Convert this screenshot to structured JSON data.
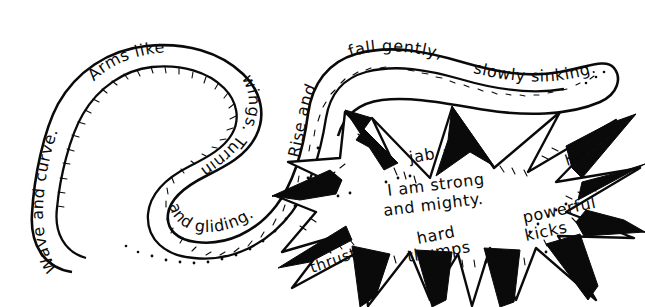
{
  "artwork": {
    "title": "Movement Words Shape Poem",
    "medium": "hand-drawn black ink line art on white paper",
    "ink_color": "#0a0a0a",
    "paper_color": "#ffffff"
  },
  "wave_shape": {
    "name": "flowing wave ribbon",
    "description": "A long serpentine double-outlined ribbon that snakes across the left and top of the page with words lettered along its curving band.",
    "phrase_full": "Wave and curve. Arms like wings. Turning and gliding. Rise and fall gently, slowly sinking.",
    "segments": [
      {
        "id": "seg1",
        "text": "Wave and curve."
      },
      {
        "id": "seg2",
        "text": "Arms like"
      },
      {
        "id": "seg3",
        "text": "wings. Turning"
      },
      {
        "id": "seg4",
        "text": "and gliding."
      },
      {
        "id": "seg5",
        "text": "Rise and"
      },
      {
        "id": "seg6",
        "text": "fall gently,"
      },
      {
        "id": "seg7",
        "text": "slowly sinking."
      }
    ]
  },
  "burst_shape": {
    "name": "jagged starburst",
    "description": "A spiky explosion / star burst outline filled white with black solid spikes, holding forceful action words.",
    "center_phrase": "I am strong and mighty.",
    "center_lines": [
      "I am strong",
      "and mighty."
    ],
    "words": [
      {
        "id": "word-jab",
        "text": "jab"
      },
      {
        "id": "word-hit",
        "text": "hit"
      },
      {
        "id": "word-powerful",
        "text": "powerful"
      },
      {
        "id": "word-kicks",
        "text": "kicks"
      },
      {
        "id": "word-hard",
        "text": "hard"
      },
      {
        "id": "word-thumps",
        "text": "thumps"
      },
      {
        "id": "word-thrust",
        "text": "thrust"
      }
    ]
  }
}
